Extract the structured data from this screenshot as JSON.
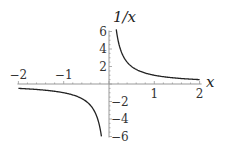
{
  "chart_data": {
    "type": "line",
    "title": "1/x",
    "xlabel": "x",
    "ylabel": "1/x",
    "xlim": [
      -2,
      2
    ],
    "ylim": [
      -6,
      6
    ],
    "grid": false,
    "legend": null,
    "x_ticks": [
      -2,
      -1,
      1,
      2
    ],
    "x_tick_labels": [
      "-2",
      "-1",
      "1",
      "2"
    ],
    "y_ticks": [
      6,
      4,
      2,
      -2,
      -4,
      -6
    ],
    "y_tick_labels": [
      "6",
      "4",
      "2",
      "-2",
      "-4",
      "-6"
    ],
    "series": [
      {
        "name": "1/x",
        "function": "1/x",
        "branches": [
          {
            "x_range": [
              -2,
              -0.167
            ],
            "description": "negative branch"
          },
          {
            "x_range": [
              0.16,
              2
            ],
            "description": "positive branch"
          }
        ],
        "sample_points": [
          {
            "x": -2,
            "y": -0.5
          },
          {
            "x": -1,
            "y": -1
          },
          {
            "x": -0.5,
            "y": -2
          },
          {
            "x": -0.25,
            "y": -4
          },
          {
            "x": -0.167,
            "y": -6
          },
          {
            "x": 0.16,
            "y": 6.25
          },
          {
            "x": 0.25,
            "y": 4
          },
          {
            "x": 0.5,
            "y": 2
          },
          {
            "x": 1,
            "y": 1
          },
          {
            "x": 2,
            "y": 0.5
          }
        ]
      }
    ],
    "colors": {
      "curve": "#222222",
      "axis": "#999999"
    }
  },
  "labels": {
    "y_title": "1/x",
    "x_title": "x"
  }
}
